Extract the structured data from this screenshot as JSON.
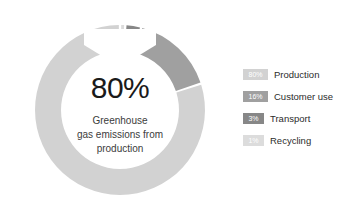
{
  "chart_data": {
    "type": "pie",
    "variant": "donut",
    "title": "",
    "center_value": "80%",
    "center_caption_lines": [
      "Greenhouse",
      "gas emissions from",
      "production"
    ],
    "categories": [
      "Production",
      "Customer use",
      "Transport",
      "Recycling"
    ],
    "values": [
      80,
      16,
      3,
      1
    ],
    "value_labels": [
      "80%",
      "16%",
      "3%",
      "1%"
    ],
    "colors": [
      "#d2d2d2",
      "#a0a0a0",
      "#878787",
      "#dcdcdc"
    ],
    "legend_position": "right",
    "grid": false,
    "units": "percent",
    "rotation_start_deg": -90,
    "direction": "counterclockwise",
    "gap_deg": 1.6
  },
  "figure": {
    "background": "#ffffff",
    "notch": {
      "name": "inner-chevron-notch",
      "shape": "v-notch",
      "position": "top-center"
    }
  },
  "center": {
    "value": "80%",
    "line1": "Greenhouse",
    "line2": "gas emissions from",
    "line3": "production"
  },
  "legend": {
    "items": [
      {
        "percent": "80%",
        "label": "Production",
        "color": "#d2d2d2",
        "chip_width": 25
      },
      {
        "percent": "16%",
        "label": "Customer use",
        "color": "#a0a0a0",
        "chip_width": 25
      },
      {
        "percent": "3%",
        "label": "Transport",
        "color": "#878787",
        "chip_width": 21
      },
      {
        "percent": "1%",
        "label": "Recycling",
        "color": "#dcdcdc",
        "chip_width": 21
      }
    ]
  }
}
